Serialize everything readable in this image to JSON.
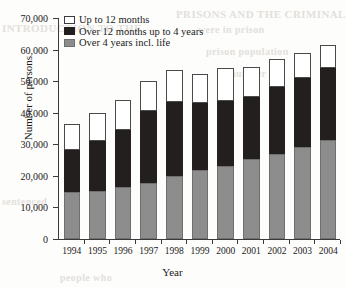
{
  "chart_data": {
    "type": "bar",
    "stacked": true,
    "title": "",
    "xlabel": "Year",
    "ylabel": "Number of persons",
    "categories": [
      "1994",
      "1995",
      "1996",
      "1997",
      "1998",
      "1999",
      "2000",
      "2001",
      "2002",
      "2003",
      "2004"
    ],
    "series": [
      {
        "name": "Over 4 years incl. life",
        "color": "#8d8d8d",
        "values": [
          14800,
          15100,
          16600,
          17800,
          20100,
          21700,
          23200,
          25200,
          27000,
          29000,
          31300
        ]
      },
      {
        "name": "Over 12 months up to 4 years",
        "color": "#231f1f",
        "values": [
          13400,
          16100,
          17800,
          22700,
          23200,
          21300,
          20500,
          19800,
          21000,
          22000,
          22900
        ]
      },
      {
        "name": "Up to 12 months",
        "color": "#ffffff",
        "values": [
          8300,
          8800,
          9500,
          9600,
          10100,
          9300,
          10600,
          9400,
          9000,
          8000,
          7200
        ]
      }
    ],
    "cumulative_tops": [
      {
        "year": "1994",
        "gray": 14800,
        "gray_plus_black": 28200,
        "total": 36500
      },
      {
        "year": "1995",
        "gray": 15100,
        "gray_plus_black": 31200,
        "total": 40000
      },
      {
        "year": "1996",
        "gray": 16600,
        "gray_plus_black": 34400,
        "total": 43900
      },
      {
        "year": "1997",
        "gray": 17800,
        "gray_plus_black": 40500,
        "total": 50100
      },
      {
        "year": "1998",
        "gray": 20100,
        "gray_plus_black": 43300,
        "total": 53400
      },
      {
        "year": "1999",
        "gray": 21700,
        "gray_plus_black": 43000,
        "total": 52300
      },
      {
        "year": "2000",
        "gray": 23200,
        "gray_plus_black": 43700,
        "total": 54300
      },
      {
        "year": "2001",
        "gray": 25200,
        "gray_plus_black": 45000,
        "total": 54400
      },
      {
        "year": "2002",
        "gray": 27000,
        "gray_plus_black": 48000,
        "total": 57000
      },
      {
        "year": "2003",
        "gray": 29000,
        "gray_plus_black": 51000,
        "total": 59000
      },
      {
        "year": "2004",
        "gray": 31300,
        "gray_plus_black": 54200,
        "total": 61400
      }
    ],
    "ylim": [
      0,
      70000
    ],
    "ytick_values": [
      0,
      10000,
      20000,
      30000,
      40000,
      50000,
      60000,
      70000
    ],
    "ytick_labels": [
      "0",
      "10,000",
      "20,000",
      "30,000",
      "40,000",
      "50,000",
      "60,000",
      "70,000"
    ],
    "grid": false,
    "legend_position": "top-left",
    "legend": [
      {
        "label": "Up to 12 months",
        "swatch": "white"
      },
      {
        "label": "Over 12 months up to 4 years",
        "swatch": "black"
      },
      {
        "label": "Over 4 years incl. life",
        "swatch": "gray"
      }
    ]
  },
  "background_ghost_text": [
    {
      "text": "PRISONS AND THE CRIMINAL",
      "x": 176,
      "y": 8,
      "size": 11
    },
    {
      "text": "INTRODUCTION TO THE",
      "x": 2,
      "y": 22,
      "size": 11
    },
    {
      "text": "were in prison",
      "x": 198,
      "y": 24,
      "size": 10
    },
    {
      "text": "prison population",
      "x": 206,
      "y": 46,
      "size": 10
    },
    {
      "text": "number of",
      "x": 230,
      "y": 68,
      "size": 10
    },
    {
      "text": "sentenced",
      "x": 2,
      "y": 196,
      "size": 10
    },
    {
      "text": "people who",
      "x": 60,
      "y": 272,
      "size": 10
    }
  ]
}
